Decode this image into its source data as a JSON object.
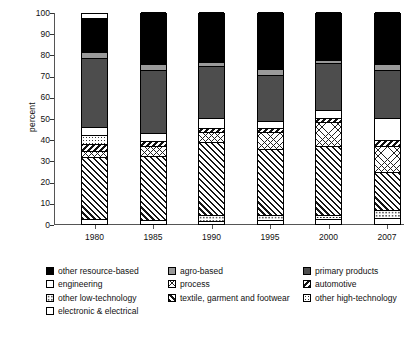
{
  "chart_data": {
    "type": "bar",
    "subtype": "stacked-bar-100",
    "title": "",
    "xlabel": "",
    "ylabel": "percent",
    "ylim": [
      0,
      100
    ],
    "yticks": [
      0,
      10,
      20,
      30,
      40,
      50,
      60,
      70,
      80,
      90,
      100
    ],
    "grid": false,
    "legend_position": "bottom",
    "categories": [
      "1980",
      "1985",
      "1990",
      "1995",
      "2000",
      "2007"
    ],
    "series": [
      {
        "name": "electronic & electrical",
        "pattern": "circles-grid",
        "values": [
          2.0,
          1.5,
          1.0,
          1.5,
          2.0,
          2.5
        ]
      },
      {
        "name": "other low-technology",
        "pattern": "dots-sparse",
        "values": [
          0.0,
          0.0,
          3.0,
          2.5,
          2.0,
          3.5
        ]
      },
      {
        "name": "textile, garment and footwear",
        "pattern": "dense-diagonal",
        "values": [
          29.0,
          30.0,
          34.0,
          31.0,
          32.5,
          18.0
        ]
      },
      {
        "name": "process",
        "pattern": "lattice-diamond",
        "values": [
          3.0,
          5.0,
          5.0,
          8.0,
          11.0,
          12.5
        ]
      },
      {
        "name": "automotive",
        "pattern": "bold-diagonal",
        "values": [
          3.5,
          2.0,
          2.0,
          2.0,
          2.0,
          2.5
        ]
      },
      {
        "name": "other high-technology",
        "pattern": "dots-light",
        "values": [
          4.0,
          0.0,
          0.0,
          0.0,
          0.0,
          0.0
        ]
      },
      {
        "name": "engineering",
        "pattern": "solid-white",
        "values": [
          4.0,
          4.0,
          4.5,
          3.0,
          4.0,
          10.5
        ]
      },
      {
        "name": "primary products",
        "pattern": "solid-dark-gray",
        "values": [
          32.5,
          29.5,
          24.5,
          22.0,
          22.0,
          22.5
        ]
      },
      {
        "name": "agro-based",
        "pattern": "solid-light-gray",
        "values": [
          2.5,
          3.0,
          2.0,
          2.5,
          1.5,
          3.0
        ]
      },
      {
        "name": "other resource-based",
        "pattern": "solid-black",
        "values": [
          16.5,
          25.0,
          24.0,
          27.5,
          23.0,
          25.0
        ]
      }
    ]
  },
  "axis": {
    "y_label": "percent",
    "y_ticks": [
      "100",
      "90",
      "80",
      "70",
      "60",
      "50",
      "40",
      "30",
      "20",
      "10",
      "0"
    ],
    "x_ticks": [
      "1980",
      "1985",
      "1990",
      "1995",
      "2000",
      "2007"
    ]
  },
  "legend": {
    "column1": [
      {
        "label": "other resource-based",
        "pattern": "solid-black"
      },
      {
        "label": "engineering",
        "pattern": "solid-white"
      },
      {
        "label": "other low-technology",
        "pattern": "dots-sparse"
      },
      {
        "label": "electronic & electrical",
        "pattern": "circles-grid"
      }
    ],
    "column2": [
      {
        "label": "agro-based",
        "pattern": "solid-light-gray"
      },
      {
        "label": "process",
        "pattern": "lattice-diamond"
      },
      {
        "label": "textile, garment and footwear",
        "pattern": "dense-diagonal"
      }
    ],
    "column3": [
      {
        "label": "primary products",
        "pattern": "solid-dark-gray"
      },
      {
        "label": "automotive",
        "pattern": "bold-diagonal"
      },
      {
        "label": "other high-technology",
        "pattern": "dots-light"
      }
    ]
  },
  "colors": {
    "solid_black": "#000000",
    "solid_dark_gray": "#4d4d4d",
    "solid_light_gray": "#9a9a9a",
    "solid_white": "#ffffff",
    "axis": "#555555",
    "text": "#111111"
  }
}
